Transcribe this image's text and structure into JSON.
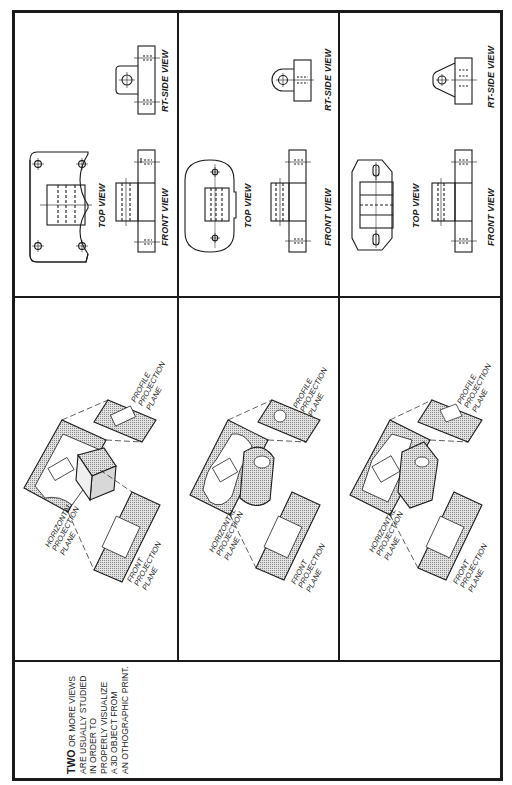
{
  "page": {
    "orientation": "rotated-90-ccw",
    "border_color": "#1a1a1a",
    "plane_fill": "#c8c8c8"
  },
  "note": {
    "lead": "TWO",
    "lines": [
      " OR MORE VIEWS",
      "ARE USUALLY STUDIED",
      "IN ORDER TO",
      "PROPERLY VISUALIZE",
      "A 3D OBJECT FROM",
      "AN OTHOGRAPHIC PRINT."
    ]
  },
  "rows": [
    {
      "id": "object-1",
      "pictorial": {
        "horizontal_plane_label": [
          "HORIZONTAL",
          "PROJECTION",
          "PLANE"
        ],
        "front_plane_label": [
          "FRONT",
          "PROJECTION",
          "PLANE"
        ],
        "profile_plane_label": [
          "PROFILE",
          "PROJECTION",
          "PLANE"
        ]
      },
      "views": {
        "top": "TOP VIEW",
        "front": "FRONT VIEW",
        "side": "RT-SIDE VIEW"
      }
    },
    {
      "id": "object-2",
      "pictorial": {
        "horizontal_plane_label": [
          "HORIZONTAL",
          "PROJECTION",
          "PLANE"
        ],
        "front_plane_label": [
          "FRONT",
          "PROJECTION",
          "PLANE"
        ],
        "profile_plane_label": [
          "PROFILE",
          "PROJECTION",
          "PLANE"
        ]
      },
      "views": {
        "top": "TOP VIEW",
        "front": "FRONT VIEW",
        "side": "RT-SIDE VIEW"
      }
    },
    {
      "id": "object-3",
      "pictorial": {
        "horizontal_plane_label": [
          "HORIZONTAL",
          "PROJECTION",
          "PLANE"
        ],
        "front_plane_label": [
          "FRONT",
          "PROJECTION",
          "PLANE"
        ],
        "profile_plane_label": [
          "PROFILE",
          "PROJECTION",
          "PLANE"
        ]
      },
      "views": {
        "top": "TOP VIEW",
        "front": "FRONT VIEW",
        "side": "RT-SIDE VIEW"
      }
    }
  ]
}
